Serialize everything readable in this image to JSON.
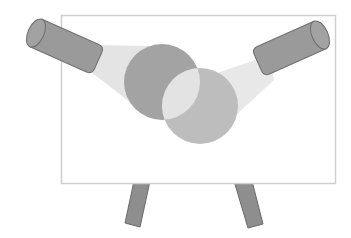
{
  "diagram": {
    "colors": {
      "background": "#ffffff",
      "board_fill": "#ffffff",
      "board_border": "#cfcfcf",
      "beam": "#e4e4e4",
      "spotlight_body": "#9a9a9a",
      "spotlight_outline": "#6e6e6e",
      "circle_dark": "#a3a3a3",
      "circle_light": "#bdbdbd",
      "circle_overlap": "#e3e3e3",
      "leg_fill": "#8e8e8e",
      "leg_outline": "#6a6a6a"
    },
    "elements": {
      "board": {
        "x": 61,
        "y": 15,
        "width": 274,
        "height": 168
      },
      "circle_dark": {
        "cx": 162,
        "cy": 82,
        "r": 38
      },
      "circle_light": {
        "cx": 200,
        "cy": 106,
        "r": 38
      },
      "left_spotlight": {
        "direction": "pointing down-right"
      },
      "right_spotlight": {
        "direction": "pointing down-left"
      },
      "legs": 2
    }
  }
}
